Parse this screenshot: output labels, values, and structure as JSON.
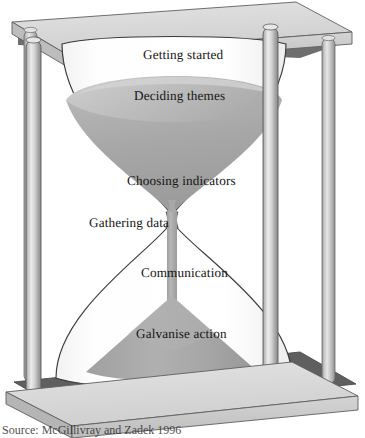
{
  "figure": {
    "caption": "Source: McGillivray and Zadek 1996",
    "background_color": "#ffffff"
  },
  "colors": {
    "frame_top_face": "#d9d9d9",
    "frame_front_face": "#c6c6c6",
    "frame_side_face": "#b0b0b0",
    "frame_shadow_face": "#6d6d6d",
    "pillar_light": "#e4e4e4",
    "pillar_mid": "#b4b4b4",
    "pillar_dark": "#8f8f8f",
    "glass_fill": "#fdfdfd",
    "glass_outline": "#3a3a3a",
    "sand_light": "#b9b9b9",
    "sand_mid": "#a6a6a6",
    "sand_dark": "#9a9a9a",
    "sand_surface": "#c2c2c2",
    "text": "#141414"
  },
  "stages": [
    {
      "id": "getting-started",
      "label": "Getting started",
      "x": 143,
      "y": 48,
      "order": 1
    },
    {
      "id": "deciding-themes",
      "label": "Deciding themes",
      "x": 134,
      "y": 89,
      "order": 2
    },
    {
      "id": "choosing-indicators",
      "label": "Choosing indicators",
      "x": 127,
      "y": 174,
      "order": 3
    },
    {
      "id": "gathering-data",
      "label": "Gathering data",
      "x": 89,
      "y": 216,
      "order": 4
    },
    {
      "id": "communication",
      "label": "Communication",
      "x": 141,
      "y": 266,
      "order": 5
    },
    {
      "id": "galvanise-action",
      "label": "Galvanise action",
      "x": 136,
      "y": 327,
      "order": 6
    }
  ],
  "parts": {
    "top_plate": "top-plate",
    "base_plate": "base-plate",
    "pillar_front_left": "pillar-front-left",
    "pillar_back_left": "pillar-back-left",
    "pillar_front_right": "pillar-front-right",
    "pillar_back_right": "pillar-back-right",
    "upper_bulb": "upper-bulb",
    "lower_bulb": "lower-bulb",
    "neck": "neck",
    "sand_upper": "sand-upper",
    "sand_stream": "sand-stream",
    "sand_cone": "sand-cone"
  }
}
